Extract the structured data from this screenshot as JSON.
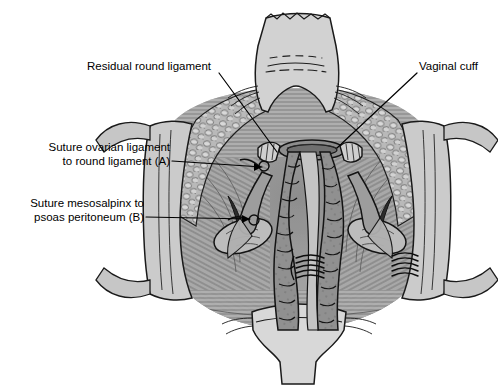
{
  "figure": {
    "background_color": "#ffffff",
    "ink_color": "#000000"
  },
  "labels": [
    {
      "id": "residual-round-ligament",
      "text": "Residual round ligament",
      "lines": [
        "Residual round ligament"
      ],
      "align": "left",
      "x": 87,
      "y": 59,
      "leader": {
        "x1": 219,
        "y1": 73,
        "x2": 277,
        "y2": 152
      }
    },
    {
      "id": "vaginal-cuff",
      "text": "Vaginal cuff",
      "lines": [
        "Vaginal cuff"
      ],
      "align": "left",
      "x": 419,
      "y": 59,
      "leader": {
        "x1": 417,
        "y1": 73,
        "x2": 337,
        "y2": 148
      }
    },
    {
      "id": "suture-ovarian-to-round-ligament-a",
      "text": "Suture ovarian ligament to round ligament (A)",
      "lines": [
        "Suture ovarian ligament",
        "to round ligament (A)"
      ],
      "align": "right",
      "x": 42,
      "y": 140,
      "leader": {
        "x1": 172,
        "y1": 161,
        "x2": 262,
        "y2": 168
      }
    },
    {
      "id": "suture-mesosalpinx-to-psoas-peritoneum-b",
      "text": "Suture mesosalpinx to psoas peritoneum (B)",
      "lines": [
        "Suture mesosalpinx to",
        "psoas peritoneum (B)"
      ],
      "align": "right",
      "x": 13,
      "y": 196,
      "leader": {
        "x1": 146,
        "y1": 217,
        "x2": 252,
        "y2": 219
      }
    }
  ],
  "anatomy": {
    "structures": [
      {
        "name": "abdominal-wall-retractor-top",
        "tone": "#cfcfcf"
      },
      {
        "name": "abdominal-wall-retractor-bottom",
        "tone": "#d2d2d2"
      },
      {
        "name": "abdominal-wall-retractor-left",
        "tone": "#c9c9c9"
      },
      {
        "name": "abdominal-wall-retractor-right",
        "tone": "#c9c9c9"
      },
      {
        "name": "subcutaneous-fat-cobblestone",
        "tone": "#b4b4b4"
      },
      {
        "name": "peritoneum-striated-field",
        "tone": "#aaaaaa"
      },
      {
        "name": "small-bowel-loop-left",
        "tone": "#8f8f8f"
      },
      {
        "name": "small-bowel-loop-right",
        "tone": "#8a8a8a"
      },
      {
        "name": "vaginal-cuff-ring",
        "tone": "#7d7d7d"
      },
      {
        "name": "ovary-left",
        "tone": "#b2b2b2"
      },
      {
        "name": "ovary-right",
        "tone": "#b2b2b2"
      },
      {
        "name": "fallopian-tube-left",
        "tone": "#9a9a9a"
      },
      {
        "name": "fallopian-tube-right",
        "tone": "#9a9a9a"
      },
      {
        "name": "round-ligament-stump-left",
        "tone": "#b8b8b8"
      },
      {
        "name": "round-ligament-stump-right",
        "tone": "#b8b8b8"
      },
      {
        "name": "suture-bundle-a",
        "tone": "#111111"
      },
      {
        "name": "suture-bundle-b",
        "tone": "#111111"
      }
    ]
  }
}
